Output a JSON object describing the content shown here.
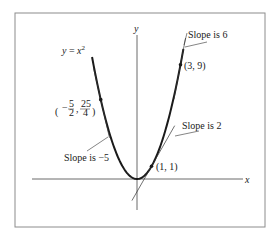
{
  "figure": {
    "function_label": "y = x²",
    "function_label_parts": {
      "lhs": "y",
      "eq": " = ",
      "var": "x",
      "exp": "2"
    },
    "axes": {
      "x_label": "x",
      "y_label": "y"
    },
    "points": [
      {
        "name": "point-neg-five-halves",
        "x": -2.5,
        "y": 6.25,
        "label_parts": {
          "n1": "5",
          "d1": "2",
          "n2": "25",
          "d2": "4"
        },
        "slope": -5,
        "slope_label": "Slope is −5"
      },
      {
        "name": "point-one-one",
        "x": 1,
        "y": 1,
        "label": "(1, 1)",
        "slope": 2,
        "slope_label": "Slope is 2"
      },
      {
        "name": "point-three-nine",
        "x": 3,
        "y": 9,
        "label": "(3, 9)",
        "slope": 6,
        "slope_label": "Slope is 6"
      }
    ],
    "colors": {
      "curve": "#1a1a1a",
      "frame": "#8c8c8c",
      "axis": "#444444"
    }
  }
}
